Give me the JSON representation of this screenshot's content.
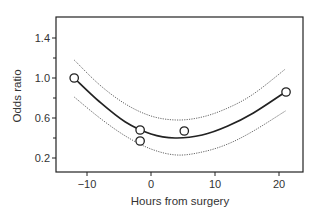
{
  "chart_data": {
    "type": "line",
    "title": "",
    "xlabel": "Hours from surgery",
    "ylabel": "Odds ratio",
    "xlim": [
      -14.5,
      23.8
    ],
    "ylim": [
      0.06,
      1.61
    ],
    "x_ticks": [
      -10,
      0,
      10,
      20
    ],
    "x_tick_labels": [
      "−10",
      "0",
      "10",
      "20"
    ],
    "y_ticks": [
      0.2,
      0.6,
      1.0,
      1.4
    ],
    "y_tick_labels": [
      "0.2",
      "0.6",
      "1.0",
      "1.4"
    ],
    "y_minor_ticks": [
      0.4,
      0.8,
      1.2
    ],
    "grid": false,
    "legend": null,
    "series": [
      {
        "name": "Fitted odds ratio",
        "style": "solid",
        "x": [
          -12,
          -8,
          -4,
          0,
          3.75,
          8,
          12,
          16,
          21
        ],
        "values": [
          1.0,
          0.76,
          0.56,
          0.44,
          0.4,
          0.43,
          0.52,
          0.65,
          0.86
        ]
      },
      {
        "name": "Upper confidence limit",
        "style": "dotted",
        "x": [
          -12,
          -8,
          -4,
          0,
          4,
          8,
          12,
          16,
          21
        ],
        "values": [
          1.18,
          0.93,
          0.74,
          0.62,
          0.58,
          0.61,
          0.7,
          0.84,
          1.09
        ]
      },
      {
        "name": "Lower confidence limit",
        "style": "dotted",
        "x": [
          -12,
          -8,
          -4,
          0,
          4,
          8,
          12,
          16,
          21
        ],
        "values": [
          0.81,
          0.6,
          0.42,
          0.29,
          0.23,
          0.26,
          0.34,
          0.47,
          0.67
        ]
      },
      {
        "name": "Observed",
        "style": "open-circle",
        "x": [
          -12,
          -1.7,
          -1.7,
          5.2,
          21.1
        ],
        "values": [
          1.0,
          0.48,
          0.37,
          0.47,
          0.86
        ]
      }
    ]
  }
}
